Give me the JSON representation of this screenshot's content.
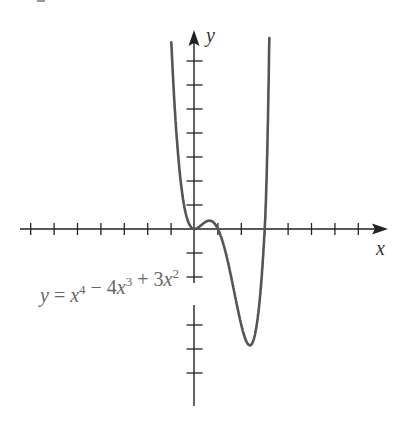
{
  "chart_data": {
    "type": "line",
    "title": "",
    "xlabel": "x",
    "ylabel": "y",
    "equation_label": {
      "parts": [
        {
          "text": "y",
          "italic": true
        },
        {
          "text": " = ",
          "italic": false
        },
        {
          "text": "x",
          "italic": true
        },
        {
          "text": "4",
          "sup": true
        },
        {
          "text": " − 4",
          "italic": false
        },
        {
          "text": "x",
          "italic": true
        },
        {
          "text": "3",
          "sup": true
        },
        {
          "text": " + 3",
          "italic": false
        },
        {
          "text": "x",
          "italic": true
        },
        {
          "text": "2",
          "sup": true
        }
      ],
      "plain": "y = x^4 − 4x^3 + 3x^2"
    },
    "function": "x^4 - 4x^3 + 3x^2",
    "xlim": [
      -7.5,
      8
    ],
    "ylim": [
      -7.5,
      8
    ],
    "x_ticks_left": [
      -7,
      -6,
      -5,
      -4,
      -3,
      -2,
      -1
    ],
    "x_ticks_right": [
      1,
      2,
      3,
      4,
      5,
      6,
      7
    ],
    "y_ticks_up": [
      1,
      2,
      3,
      4,
      5,
      6,
      7
    ],
    "y_ticks_down": [
      -1,
      -2,
      -3,
      -4,
      -5,
      -6
    ],
    "grid": false,
    "legend": null,
    "key_points": [
      {
        "name": "x-intercept",
        "x": 0,
        "y": 0
      },
      {
        "name": "local max",
        "x": 0.63,
        "y": 0.35
      },
      {
        "name": "x-intercept",
        "x": 1,
        "y": 0
      },
      {
        "name": "local min",
        "x": 2.37,
        "y": -4.85
      },
      {
        "name": "x-intercept",
        "x": 3,
        "y": 0
      }
    ],
    "curve_color": "#555555",
    "axis_color": "#222222"
  }
}
